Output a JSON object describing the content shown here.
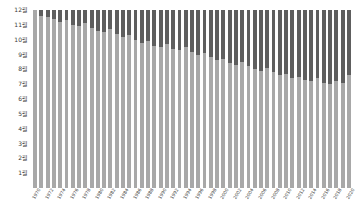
{
  "chart_data": {
    "type": "bar",
    "title": "",
    "subtitle": "",
    "xlabel": "",
    "ylabel": "",
    "grid": false,
    "legend_position": "none",
    "stacked": true,
    "ylim": [
      0,
      12
    ],
    "ytick_labels": [
      "1월",
      "2월",
      "3월",
      "4월",
      "5월",
      "6월",
      "7월",
      "8월",
      "9월",
      "10월",
      "11월",
      "12월"
    ],
    "ytick_values": [
      1,
      2,
      3,
      4,
      5,
      6,
      7,
      8,
      9,
      10,
      11,
      12
    ],
    "categories": [
      "1970",
      "1971",
      "1972",
      "1973",
      "1974",
      "1975",
      "1976",
      "1977",
      "1978",
      "1979",
      "1980",
      "1981",
      "1982",
      "1983",
      "1984",
      "1985",
      "1986",
      "1987",
      "1988",
      "1989",
      "1990",
      "1991",
      "1992",
      "1993",
      "1994",
      "1995",
      "1996",
      "1997",
      "1998",
      "1999",
      "2000",
      "2001",
      "2002",
      "2003",
      "2004",
      "2005",
      "2006",
      "2007",
      "2008",
      "2009",
      "2010",
      "2011",
      "2012",
      "2013",
      "2014",
      "2015",
      "2016",
      "2017",
      "2018",
      "2019",
      "2020"
    ],
    "xtick_labels_shown": [
      "1970",
      "1972",
      "1974",
      "1976",
      "1978",
      "1980",
      "1982",
      "1984",
      "1986",
      "1988",
      "1990",
      "1992",
      "1994",
      "1996",
      "1998",
      "2000",
      "2002",
      "2004",
      "2006",
      "2008",
      "2010",
      "2012",
      "2014",
      "2016",
      "2018",
      "2020"
    ],
    "series": [
      {
        "name": "light-lower",
        "color": "#a8a8a8",
        "values": [
          12.0,
          11.6,
          11.5,
          11.4,
          11.2,
          11.3,
          11.0,
          10.9,
          11.1,
          10.8,
          10.6,
          10.5,
          10.7,
          10.4,
          10.2,
          10.3,
          10.0,
          9.8,
          9.9,
          9.6,
          9.5,
          9.7,
          9.4,
          9.3,
          9.5,
          9.2,
          9.0,
          9.1,
          8.8,
          8.6,
          8.7,
          8.4,
          8.3,
          8.5,
          8.2,
          8.0,
          7.9,
          8.1,
          7.8,
          7.6,
          7.7,
          7.4,
          7.5,
          7.3,
          7.2,
          7.4,
          7.1,
          7.0,
          7.2,
          7.1,
          7.6
        ]
      },
      {
        "name": "dark-upper",
        "color": "#5e5e5e",
        "values": [
          0.0,
          0.4,
          0.5,
          0.6,
          0.8,
          0.7,
          1.0,
          1.1,
          0.9,
          1.2,
          1.4,
          1.5,
          1.3,
          1.6,
          1.8,
          1.7,
          2.0,
          2.2,
          2.1,
          2.4,
          2.5,
          2.3,
          2.6,
          2.7,
          2.5,
          2.8,
          3.0,
          2.9,
          3.2,
          3.4,
          3.3,
          3.6,
          3.7,
          3.5,
          3.8,
          4.0,
          4.1,
          3.9,
          4.2,
          4.4,
          4.3,
          4.6,
          4.5,
          4.7,
          4.8,
          4.6,
          4.9,
          5.0,
          4.8,
          4.9,
          4.4
        ]
      }
    ]
  },
  "colors": {
    "light_segment": "#a8a8a8",
    "dark_segment": "#5e5e5e",
    "background": "#ffffff",
    "tick_text": "#3a3a3a"
  }
}
